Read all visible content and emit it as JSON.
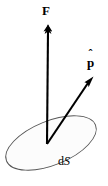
{
  "figure": {
    "background_color": "#ffffff",
    "stroke_color": "#000000",
    "surface_fill_color": "#fcfcfc",
    "surface_outline_color": "#555555",
    "labels": {
      "force_vector": "F",
      "unit_vector_base": "p",
      "unit_vector_hat": "ˆ",
      "surface_element_prefix": "d",
      "surface_element_symbol": "S"
    },
    "geometry": {
      "origin": {
        "x": 47,
        "y": 144
      },
      "force_tip": {
        "x": 48,
        "y": 25
      },
      "unit_tip": {
        "x": 93,
        "y": 78
      },
      "ellipse": {
        "center_x": 51,
        "center_y": 143,
        "radius_x": 48,
        "radius_y": 22,
        "rotation_deg": -22
      }
    }
  }
}
